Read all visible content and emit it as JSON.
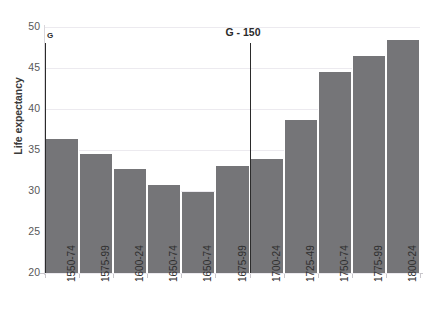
{
  "chart_data": {
    "type": "bar",
    "title": "",
    "xlabel": "",
    "ylabel": "Life expectancy",
    "ylim": [
      20,
      50
    ],
    "ytick_labels": [
      "50",
      "45",
      "40",
      "35",
      "30",
      "25",
      "20"
    ],
    "ytick_values": [
      50,
      45,
      40,
      35,
      30,
      25,
      20
    ],
    "grid": true,
    "legend": "none",
    "categories": [
      "1550-74",
      "1575-99",
      "1600-24",
      "1650-74",
      "1650-74",
      "1675-99",
      "1700-24",
      "1725-49",
      "1750-74",
      "1775-99",
      "1800-24"
    ],
    "values": [
      36.4,
      34.5,
      32.7,
      30.7,
      29.9,
      33.0,
      33.9,
      38.6,
      44.5,
      46.5,
      48.4
    ],
    "bar_color": "#757578",
    "annotations": [
      {
        "label": "G",
        "category_index": 0,
        "top_value": 48.0
      },
      {
        "label": "G - 150",
        "category_index": 6,
        "top_value": 48.0
      }
    ]
  },
  "axis": {
    "y_title": "Life expectancy"
  }
}
